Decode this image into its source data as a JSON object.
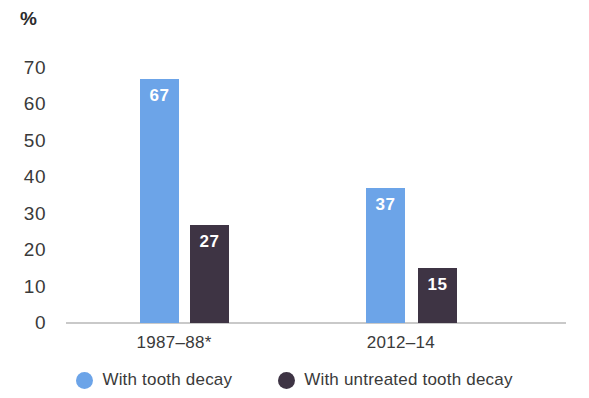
{
  "chart_data": {
    "type": "bar",
    "title": "",
    "subtitle": "",
    "xlabel": "",
    "ylabel": "%",
    "ylim": [
      0,
      70
    ],
    "ytick_labels": [
      "70",
      "60",
      "50",
      "40",
      "30",
      "20",
      "10",
      "0"
    ],
    "ytick_values": [
      70,
      60,
      50,
      40,
      30,
      20,
      10,
      0
    ],
    "grid": false,
    "legend_position": "bottom",
    "categories": [
      "1987–88*",
      "2012–14"
    ],
    "series": [
      {
        "name": "With tooth decay",
        "color": "#6ca4e8",
        "values": [
          67,
          37
        ],
        "value_labels": [
          "67",
          "37"
        ]
      },
      {
        "name": "With untreated tooth decay",
        "color": "#3e3444",
        "values": [
          27,
          15
        ],
        "value_labels": [
          "27",
          "15"
        ]
      }
    ]
  },
  "axis": {
    "unit_symbol": "%"
  },
  "legend": {
    "items": [
      {
        "label": "With tooth decay",
        "color": "#6ca4e8"
      },
      {
        "label": "With untreated tooth decay",
        "color": "#3e3444"
      }
    ]
  }
}
